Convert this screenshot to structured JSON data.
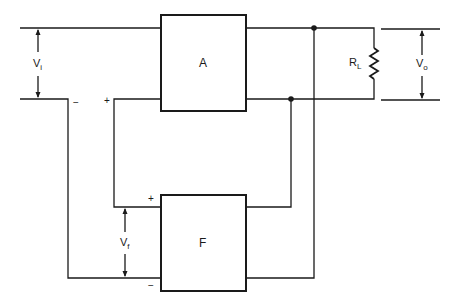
{
  "diagram": {
    "type": "feedback amplifier block diagram",
    "blocks": [
      {
        "id": "A",
        "label": "A"
      },
      {
        "id": "F",
        "label": "F"
      }
    ],
    "labels": {
      "vi_main": "V",
      "vi_sub": "i",
      "vf_main": "V",
      "vf_sub": "f",
      "vo_main": "V",
      "vo_sub": "o",
      "rl_main": "R",
      "rl_sub": "L"
    },
    "signs": {
      "input_minus": "−",
      "input_plus": "+",
      "f_plus": "+",
      "f_minus": "−"
    },
    "colors": {
      "line": "#1a1a1a",
      "background": "#ffffff"
    }
  }
}
